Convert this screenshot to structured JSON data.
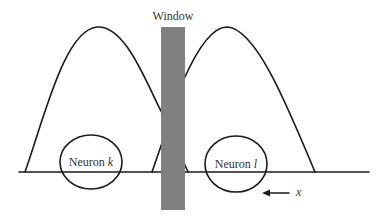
{
  "diagram": {
    "window_label": "Window",
    "window_color": "#808080",
    "line_color": "#1a1a1a",
    "neurons": [
      {
        "name": "Neuron",
        "index": "k"
      },
      {
        "name": "Neuron",
        "index": "l"
      }
    ],
    "direction_label": "x",
    "direction": "left"
  }
}
